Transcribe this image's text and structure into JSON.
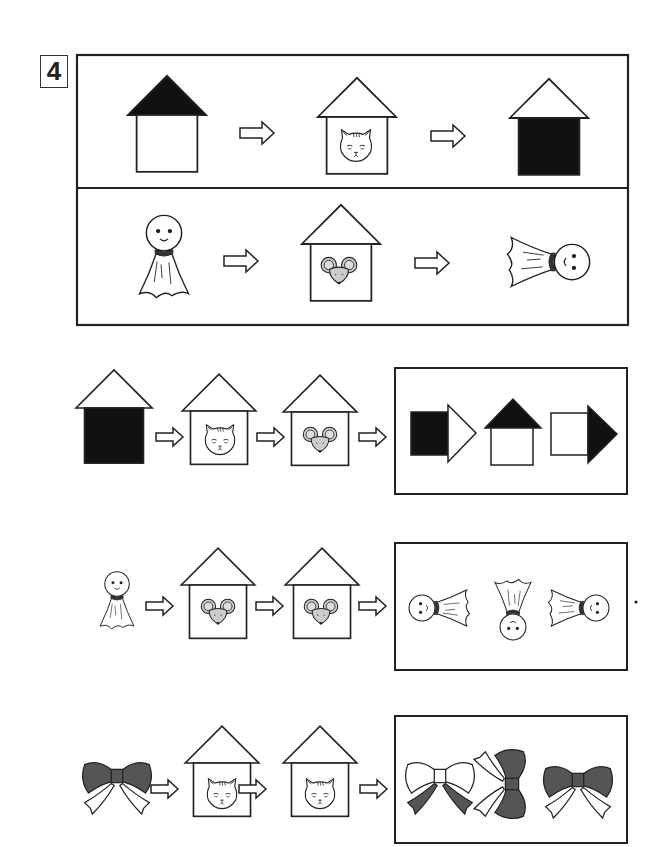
{
  "question": {
    "number": "4"
  },
  "colors": {
    "ink": "#222222",
    "dark_fill": "#111111",
    "gray_fill": "#cccccc",
    "bow_fill": "#555555"
  },
  "example_panel": {
    "rules": [
      {
        "name": "cat-house-rule",
        "items": [
          "house-black-roof",
          "arrow",
          "house-with-cat",
          "arrow",
          "house-black-body"
        ],
        "meaning": "Cat house swaps black roof to black body"
      },
      {
        "name": "mouse-house-rule",
        "items": [
          "teru-teru-bozu-upright",
          "arrow",
          "house-with-mouse",
          "arrow",
          "teru-teru-bozu-rotated-right"
        ],
        "meaning": "Mouse house rotates 90 degrees"
      }
    ]
  },
  "questions": [
    {
      "name": "question-row-1",
      "sequence": [
        "house-black-body",
        "arrow",
        "house-with-cat",
        "arrow",
        "house-with-mouse",
        "arrow"
      ],
      "choices": [
        "black-square-white-arrow",
        "house-black-roof",
        "white-square-black-arrow"
      ]
    },
    {
      "name": "question-row-2",
      "sequence": [
        "teru-teru-bozu-upright",
        "arrow",
        "house-with-mouse",
        "arrow",
        "house-with-mouse",
        "arrow"
      ],
      "choices": [
        "teru-teru-bozu-head-left",
        "teru-teru-bozu-upside-down",
        "teru-teru-bozu-head-right"
      ]
    },
    {
      "name": "question-row-3",
      "sequence": [
        "ribbon-dark-bow",
        "arrow",
        "house-with-cat",
        "arrow",
        "house-with-cat",
        "arrow"
      ],
      "choices": [
        "ribbon-white-bow-dark-tails",
        "ribbon-rotated",
        "ribbon-dark-bow"
      ]
    }
  ]
}
